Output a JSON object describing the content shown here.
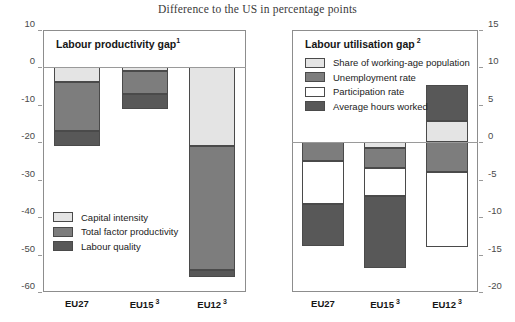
{
  "figure": {
    "title": "Difference to the US in percentage points"
  },
  "panels": {
    "left": {
      "title": "Labour productivity gap",
      "title_note": "1",
      "axis": {
        "ticks": [
          "10",
          "0",
          "-10",
          "-20",
          "-30",
          "-40",
          "-50",
          "-60"
        ],
        "min": -60,
        "max": 10
      },
      "legend": [
        {
          "label": "Capital intensity",
          "color": "#e4e4e4"
        },
        {
          "label": "Total factor productivity",
          "color": "#7d7d7d"
        },
        {
          "label": "Labour quality",
          "color": "#585858"
        }
      ],
      "categories": [
        {
          "label": "EU27",
          "note": ""
        },
        {
          "label": "EU15",
          "note": "3"
        },
        {
          "label": "EU12",
          "note": "3"
        }
      ]
    },
    "right": {
      "title": "Labour utilisation gap",
      "title_note": "2",
      "axis": {
        "ticks": [
          "15",
          "10",
          "5",
          "0",
          "-5",
          "-10",
          "-15",
          "-20"
        ],
        "min": -20,
        "max": 15
      },
      "legend": [
        {
          "label": "Share of working-age population",
          "color": "#e4e4e4"
        },
        {
          "label": "Unemployment rate",
          "color": "#7d7d7d"
        },
        {
          "label": "Participation rate",
          "color": "#ffffff"
        },
        {
          "label": "Average hours worked",
          "color": "#585858"
        }
      ],
      "categories": [
        {
          "label": "EU27",
          "note": ""
        },
        {
          "label": "EU15",
          "note": "3"
        },
        {
          "label": "EU12",
          "note": "3"
        }
      ]
    }
  },
  "chart_data": [
    {
      "type": "bar",
      "title": "Labour productivity gap",
      "subtitle": "Difference to the US in percentage points",
      "stacked": true,
      "xlabel": "",
      "ylabel": "Difference to the US in percentage points",
      "ylim": [
        -60,
        10
      ],
      "yticks": [
        10,
        0,
        -10,
        -20,
        -30,
        -40,
        -50,
        -60
      ],
      "grid": false,
      "legend_position": "inside-lower-left",
      "categories": [
        "EU27",
        "EU15",
        "EU12"
      ],
      "series": [
        {
          "name": "Capital intensity",
          "color": "#e4e4e4",
          "values": [
            -4.0,
            -1.0,
            -21.0
          ]
        },
        {
          "name": "Total factor productivity",
          "color": "#7d7d7d",
          "values": [
            -13.0,
            -6.0,
            -33.0
          ]
        },
        {
          "name": "Labour quality",
          "color": "#585858",
          "values": [
            -4.0,
            -4.0,
            -2.0
          ]
        }
      ],
      "totals": [
        -21.0,
        -11.0,
        -56.0
      ]
    },
    {
      "type": "bar",
      "title": "Labour utilisation gap",
      "subtitle": "Difference to the US in percentage points",
      "stacked": true,
      "xlabel": "",
      "ylabel": "Difference to the US in percentage points",
      "ylim": [
        -20,
        15
      ],
      "yticks": [
        15,
        10,
        5,
        0,
        -5,
        -10,
        -15,
        -20
      ],
      "grid": false,
      "legend_position": "inside-upper-left",
      "categories": [
        "EU27",
        "EU15",
        "EU12"
      ],
      "series": [
        {
          "name": "Share of working-age population",
          "color": "#e4e4e4",
          "values": [
            0.0,
            -0.7,
            2.8
          ]
        },
        {
          "name": "Unemployment rate",
          "color": "#7d7d7d",
          "values": [
            -2.5,
            -2.7,
            -4.0
          ]
        },
        {
          "name": "Participation rate",
          "color": "#ffffff",
          "values": [
            -5.8,
            -3.8,
            -10.0
          ]
        },
        {
          "name": "Average hours worked",
          "color": "#585858",
          "values": [
            -5.5,
            -9.6,
            4.9
          ]
        }
      ],
      "totals": [
        -13.8,
        -16.8,
        -6.3
      ]
    }
  ]
}
